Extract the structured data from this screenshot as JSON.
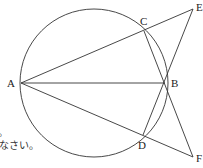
{
  "diagram": {
    "points": {
      "A": {
        "label": "A",
        "x": 21,
        "y": 83
      },
      "B": {
        "label": "B",
        "x": 165,
        "y": 83
      },
      "C": {
        "label": "C",
        "x": 144,
        "y": 31
      },
      "D": {
        "label": "D",
        "x": 143,
        "y": 135
      },
      "E": {
        "label": "E",
        "x": 193,
        "y": 9
      },
      "F": {
        "label": "F",
        "x": 193,
        "y": 157
      }
    },
    "circle": {
      "cx": 94,
      "cy": 83,
      "r": 74
    },
    "segments": [
      [
        "A",
        "E"
      ],
      [
        "A",
        "B"
      ],
      [
        "A",
        "F"
      ],
      [
        "C",
        "F"
      ],
      [
        "E",
        "D"
      ]
    ],
    "partial_text": {
      "line1": "。",
      "line2": "なさい。"
    }
  }
}
